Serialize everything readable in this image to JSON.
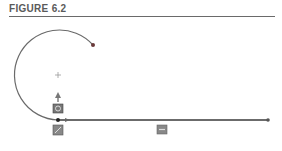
{
  "figure": {
    "title": "FIGURE 6.2"
  },
  "sketch": {
    "stroke_color": "#5a5a5a",
    "arc": {
      "center": [
        58,
        75
      ],
      "radius": 45,
      "end_point": [
        93,
        45
      ]
    },
    "line": {
      "start": [
        58,
        120
      ],
      "end": [
        268,
        120
      ]
    },
    "relations": [
      "tangent-icon",
      "horizontal-icon",
      "coincident-icon",
      "midpoint-icon"
    ]
  }
}
